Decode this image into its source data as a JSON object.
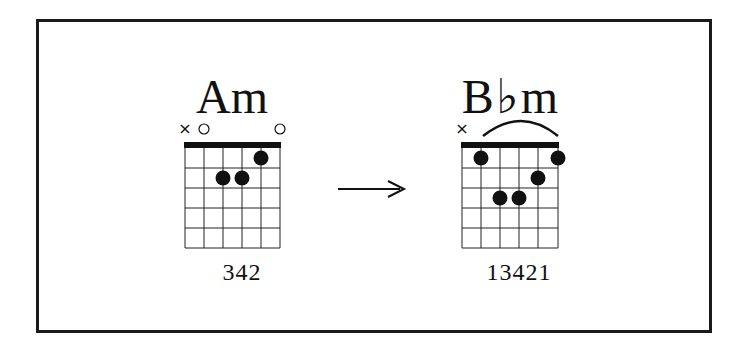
{
  "diagram": {
    "type": "guitar-chord-transition",
    "arrow": "→",
    "colors": {
      "ink": "#111111",
      "background": "#ffffff",
      "frame": "#1a1a1a"
    },
    "chords": [
      {
        "name": "Am",
        "fingering_label": "342",
        "string_markers": [
          "×",
          "○",
          "",
          "",
          "",
          "○"
        ],
        "barre": false,
        "dots": [
          {
            "string": 5,
            "fret": 1
          },
          {
            "string": 3,
            "fret": 2
          },
          {
            "string": 4,
            "fret": 2
          }
        ]
      },
      {
        "name": "B♭m",
        "name_root": "B",
        "name_accidental": "♭",
        "name_quality": "m",
        "fingering_label": "13421",
        "string_markers": [
          "×",
          "",
          "",
          "",
          "",
          ""
        ],
        "barre": true,
        "dots": [
          {
            "string": 1,
            "fret": 1
          },
          {
            "string": 5,
            "fret": 1
          },
          {
            "string": 4,
            "fret": 2
          },
          {
            "string": 2,
            "fret": 3
          },
          {
            "string": 3,
            "fret": 3
          }
        ]
      }
    ]
  }
}
